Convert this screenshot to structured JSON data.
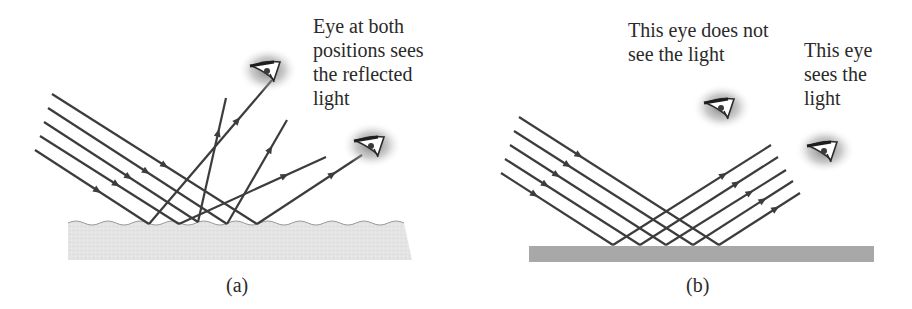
{
  "panel_a": {
    "caption": "(a)",
    "annotation_lines": [
      "Eye at both",
      "positions sees",
      "the reflected",
      "light"
    ],
    "surface": {
      "type": "rough",
      "color": "#e6e6e6",
      "edge_color": "#9a9a9a"
    },
    "incident_rays": [
      {
        "from": [
          52,
          94
        ],
        "to": [
          257,
          224
        ]
      },
      {
        "from": [
          48,
          108
        ],
        "to": [
          227,
          224
        ]
      },
      {
        "from": [
          44,
          122
        ],
        "to": [
          198,
          222
        ]
      },
      {
        "from": [
          40,
          136
        ],
        "to": [
          179,
          224
        ]
      },
      {
        "from": [
          35,
          150
        ],
        "to": [
          149,
          224
        ]
      }
    ],
    "reflected_rays": [
      {
        "from": [
          149,
          224
        ],
        "to": [
          272,
          80
        ]
      },
      {
        "from": [
          198,
          222
        ],
        "to": [
          226,
          98
        ]
      },
      {
        "from": [
          227,
          224
        ],
        "to": [
          287,
          120
        ]
      },
      {
        "from": [
          179,
          224
        ],
        "to": [
          326,
          157
        ]
      },
      {
        "from": [
          257,
          224
        ],
        "to": [
          362,
          155
        ]
      }
    ],
    "eyes": [
      {
        "name": "eye-upper",
        "x": 268,
        "y": 70
      },
      {
        "name": "eye-lower",
        "x": 372,
        "y": 145
      }
    ]
  },
  "panel_b": {
    "caption": "(b)",
    "annotation_left_lines": [
      "This eye does not",
      "see the light"
    ],
    "annotation_right_lines": [
      "This eye",
      "sees the",
      "light"
    ],
    "surface": {
      "type": "smooth",
      "color": "#a8a8a8"
    },
    "incident_rays": [
      {
        "from": [
          519,
          117
        ],
        "to": [
          719,
          245
        ]
      },
      {
        "from": [
          514,
          131
        ],
        "to": [
          693,
          245
        ]
      },
      {
        "from": [
          510,
          145
        ],
        "to": [
          666,
          245
        ]
      },
      {
        "from": [
          505,
          159
        ],
        "to": [
          640,
          245
        ]
      },
      {
        "from": [
          501,
          173
        ],
        "to": [
          613,
          245
        ]
      }
    ],
    "reflected_rays": [
      {
        "from": [
          613,
          245
        ],
        "to": [
          771,
          145
        ]
      },
      {
        "from": [
          640,
          245
        ],
        "to": [
          778,
          157
        ]
      },
      {
        "from": [
          666,
          245
        ],
        "to": [
          786,
          170
        ]
      },
      {
        "from": [
          693,
          245
        ],
        "to": [
          793,
          181
        ]
      },
      {
        "from": [
          719,
          245
        ],
        "to": [
          800,
          193
        ]
      }
    ],
    "eyes": [
      {
        "name": "eye-not-seeing",
        "x": 722,
        "y": 107
      },
      {
        "name": "eye-seeing",
        "x": 825,
        "y": 150
      }
    ]
  },
  "colors": {
    "ray": "#3c3c3c",
    "text": "#2a2a2a"
  }
}
